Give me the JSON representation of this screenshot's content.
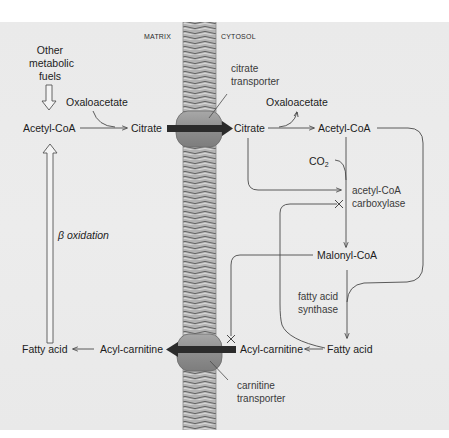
{
  "compartments": {
    "matrix": "MATRIX",
    "cytosol": "CYTOSOL"
  },
  "matrix": {
    "other_fuels": [
      "Other",
      "metabolic",
      "fuels"
    ],
    "oxaloacetate": "Oxaloacetate",
    "acetyl_coa": "Acetyl-CoA",
    "citrate": "Citrate",
    "beta_oxidation": "β oxidation",
    "fatty_acid": "Fatty acid",
    "acyl_carnitine": "Acyl-carnitine"
  },
  "cytosol": {
    "citrate": "Citrate",
    "oxaloacetate": "Oxaloacetate",
    "acetyl_coa": "Acetyl-CoA",
    "co2": "CO",
    "co2_sub": "2",
    "malonyl_coa": "Malonyl-CoA",
    "fatty_acid": "Fatty acid",
    "acyl_carnitine": "Acyl-carnitine"
  },
  "enzymes": {
    "citrate_transporter": [
      "citrate",
      "transporter"
    ],
    "acetyl_coa_carboxylase": [
      "acetyl-CoA",
      "carboxylase"
    ],
    "fatty_acid_synthase": [
      "fatty acid",
      "synthase"
    ],
    "carnitine_transporter": [
      "carnitine",
      "transporter"
    ]
  },
  "colors": {
    "background": "#ebebeb",
    "membrane": "#9a9a9a",
    "transporter": "#8c8c8c",
    "arrow_dark": "#2b2b2b",
    "line": "#4a4a4a"
  }
}
